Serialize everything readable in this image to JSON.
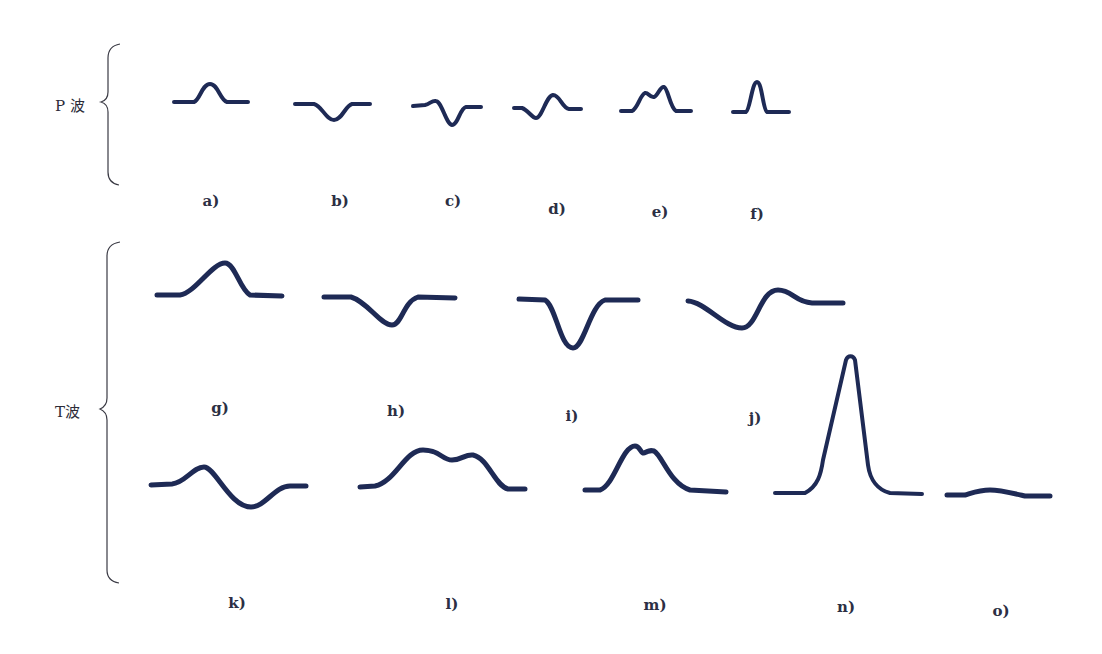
{
  "figure": {
    "wave_color": "#1e2a55",
    "groups": [
      {
        "id": "p",
        "label": "P 波"
      },
      {
        "id": "t",
        "label": "T波"
      }
    ],
    "panels": [
      {
        "id": "a",
        "label": "a)",
        "group": "P 波",
        "shape": "upright rounded"
      },
      {
        "id": "b",
        "label": "b)",
        "group": "P 波",
        "shape": "inverted"
      },
      {
        "id": "c",
        "label": "c)",
        "group": "P 波",
        "shape": "biphasic (+/-)"
      },
      {
        "id": "d",
        "label": "d)",
        "group": "P 波",
        "shape": "biphasic (-/+)"
      },
      {
        "id": "e",
        "label": "e)",
        "group": "P 波",
        "shape": "notched / bifid"
      },
      {
        "id": "f",
        "label": "f)",
        "group": "P 波",
        "shape": "tall peaked"
      },
      {
        "id": "g",
        "label": "g)",
        "group": "T波",
        "shape": "upright"
      },
      {
        "id": "h",
        "label": "h)",
        "group": "T波",
        "shape": "inverted shallow"
      },
      {
        "id": "i",
        "label": "i)",
        "group": "T波",
        "shape": "inverted deep"
      },
      {
        "id": "j",
        "label": "j)",
        "group": "T波",
        "shape": "biphasic (-/+)"
      },
      {
        "id": "k",
        "label": "k)",
        "group": "T波",
        "shape": "biphasic (+/-)"
      },
      {
        "id": "l",
        "label": "l)",
        "group": "T波",
        "shape": "notched broad"
      },
      {
        "id": "m",
        "label": "m)",
        "group": "T波",
        "shape": "notched peak"
      },
      {
        "id": "n",
        "label": "n)",
        "group": "T波",
        "shape": "tall peaked"
      },
      {
        "id": "o",
        "label": "o)",
        "group": "T波",
        "shape": "flat / low"
      }
    ]
  }
}
